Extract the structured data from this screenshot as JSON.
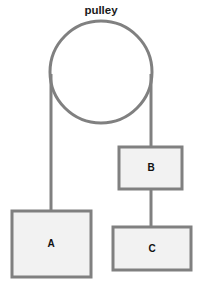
{
  "diagram": {
    "title": "pulley",
    "background_color": "#ffffff",
    "stroke_color": "#808080",
    "block_fill_color": "#f2f2f2",
    "label_color": "#111111",
    "pulley": {
      "label": "pulley",
      "label_x": 101,
      "label_y": 11,
      "cx": 101,
      "cy": 72,
      "r": 51,
      "stroke_width": 3
    },
    "ropes": [
      {
        "name": "rope-left-to-block-a",
        "x1": 51,
        "y1": 74,
        "x2": 51,
        "y2": 211,
        "stroke_width": 3
      },
      {
        "name": "rope-right-to-block-b",
        "x1": 151,
        "y1": 74,
        "x2": 151,
        "y2": 147,
        "stroke_width": 3
      },
      {
        "name": "rope-block-b-to-block-c",
        "x1": 151,
        "y1": 189,
        "x2": 151,
        "y2": 227,
        "stroke_width": 3
      }
    ],
    "blocks": [
      {
        "name": "block-a",
        "label": "A",
        "x": 12,
        "y": 211,
        "width": 79,
        "height": 66,
        "label_x": 51,
        "label_y": 244
      },
      {
        "name": "block-b",
        "label": "B",
        "x": 119,
        "y": 147,
        "width": 63,
        "height": 42,
        "label_x": 151,
        "label_y": 168
      },
      {
        "name": "block-c",
        "label": "C",
        "x": 113,
        "y": 227,
        "width": 78,
        "height": 43,
        "label_x": 152,
        "label_y": 249
      }
    ]
  }
}
